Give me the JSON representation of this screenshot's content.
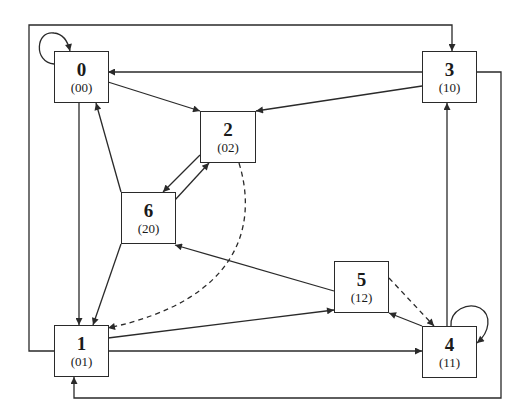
{
  "diagram": {
    "type": "state-transition-graph",
    "nodes": [
      {
        "id": "0",
        "label": "0",
        "code": "(00)"
      },
      {
        "id": "1",
        "label": "1",
        "code": "(01)"
      },
      {
        "id": "2",
        "label": "2",
        "code": "(02)"
      },
      {
        "id": "3",
        "label": "3",
        "code": "(10)"
      },
      {
        "id": "4",
        "label": "4",
        "code": "(11)"
      },
      {
        "id": "5",
        "label": "5",
        "code": "(12)"
      },
      {
        "id": "6",
        "label": "6",
        "code": "(20)"
      }
    ],
    "edges": [
      {
        "from": "0",
        "to": "0",
        "style": "solid",
        "kind": "self-loop"
      },
      {
        "from": "0",
        "to": "1",
        "style": "solid"
      },
      {
        "from": "0",
        "to": "2",
        "style": "solid"
      },
      {
        "from": "1",
        "to": "3",
        "style": "solid",
        "kind": "outer-frame"
      },
      {
        "from": "1",
        "to": "4",
        "style": "solid"
      },
      {
        "from": "1",
        "to": "5",
        "style": "solid"
      },
      {
        "from": "2",
        "to": "6",
        "style": "solid"
      },
      {
        "from": "2",
        "to": "1",
        "style": "dashed"
      },
      {
        "from": "3",
        "to": "0",
        "style": "solid"
      },
      {
        "from": "3",
        "to": "2",
        "style": "solid"
      },
      {
        "from": "3",
        "to": "1",
        "style": "solid",
        "kind": "outer-frame"
      },
      {
        "from": "4",
        "to": "3",
        "style": "solid"
      },
      {
        "from": "4",
        "to": "4",
        "style": "solid",
        "kind": "self-loop"
      },
      {
        "from": "4",
        "to": "5",
        "style": "solid"
      },
      {
        "from": "5",
        "to": "4",
        "style": "dashed"
      },
      {
        "from": "5",
        "to": "6",
        "style": "solid"
      },
      {
        "from": "6",
        "to": "0",
        "style": "solid"
      },
      {
        "from": "6",
        "to": "1",
        "style": "solid"
      },
      {
        "from": "6",
        "to": "2",
        "style": "solid"
      }
    ],
    "colors": {
      "line": "#2a2a2a",
      "background": "#ffffff"
    }
  }
}
